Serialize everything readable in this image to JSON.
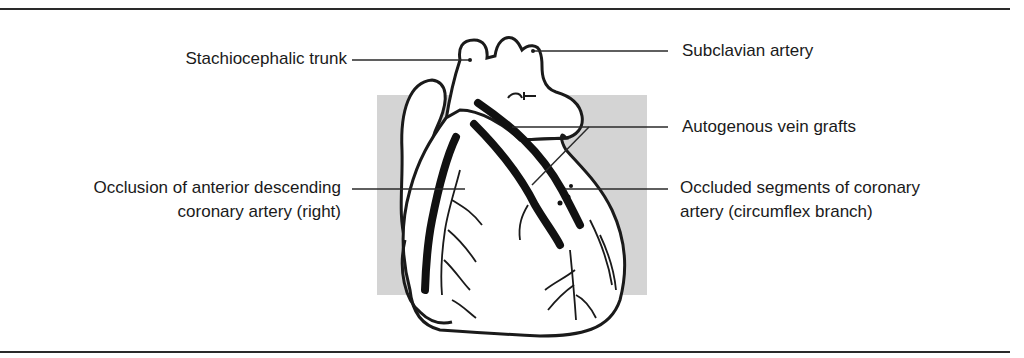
{
  "figure": {
    "type": "anatomical line illustration",
    "background_panel_color": "#d4d4d4",
    "line_color": "#1a1a1a",
    "rule_color": "#2a2a2a"
  },
  "labels": {
    "stachiocephalic_trunk": "Stachiocephalic trunk",
    "subclavian_artery": "Subclavian artery",
    "autogenous_vein_grafts": "Autogenous vein grafts",
    "occlusion_anterior_line1": "Occlusion of anterior descending",
    "occlusion_anterior_line2": "coronary artery (right)",
    "occluded_segments_line1": "Occluded segments of coronary",
    "occluded_segments_line2": "artery (circumflex branch)"
  }
}
